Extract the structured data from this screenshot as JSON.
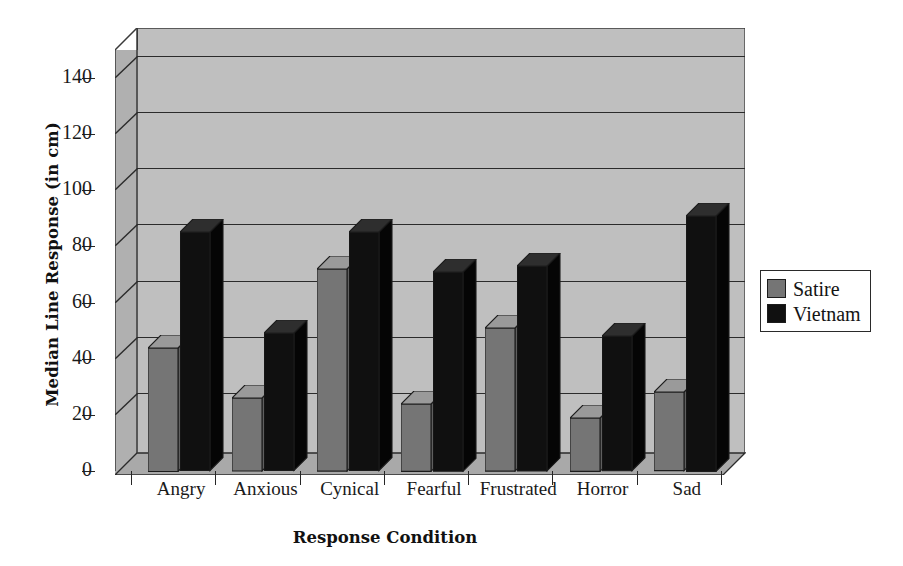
{
  "chart_data": {
    "type": "bar",
    "title": "",
    "xlabel": "Response Condition",
    "ylabel": "Median Line Response (in cm)",
    "categories": [
      "Angry",
      "Anxious",
      "Cynical",
      "Fearful",
      "Frustrated",
      "Horror",
      "Sad"
    ],
    "series": [
      {
        "name": "Satire",
        "color": "#757575",
        "values": [
          44,
          26,
          72,
          24,
          51,
          19,
          28
        ]
      },
      {
        "name": "Vietnam",
        "color": "#101010",
        "values": [
          85,
          49,
          85,
          71,
          73,
          48,
          91
        ]
      }
    ],
    "ylim": [
      0,
      150
    ],
    "yticks": [
      0,
      20,
      40,
      60,
      80,
      100,
      120,
      140
    ],
    "ytick_labels": [
      "0",
      "20",
      "40",
      "60",
      "80",
      "100",
      "120",
      "140"
    ],
    "grid": true,
    "gridlines_at": [
      20,
      40,
      60,
      80,
      100,
      120,
      140
    ],
    "legend_position": "right",
    "style": "3d-column",
    "plot_background": "#bfbfbf"
  },
  "legend": {
    "entries": [
      {
        "label": "Satire"
      },
      {
        "label": "Vietnam"
      }
    ]
  },
  "colors": {
    "satire": "#757575",
    "vietnam": "#101010",
    "plot_bg": "#bfbfbf",
    "axis": "#262626"
  }
}
